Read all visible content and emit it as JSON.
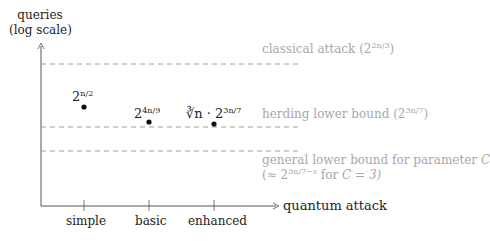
{
  "y_axis": {
    "label_line1": "queries",
    "label_line2": "(log scale)"
  },
  "x_axis": {
    "label": "quantum attack",
    "ticks": [
      "simple",
      "basic",
      "enhanced"
    ]
  },
  "points": [
    {
      "name": "simple",
      "base": "2",
      "exp": "n/2",
      "prefix": ""
    },
    {
      "name": "basic",
      "base": "2",
      "exp": "4n/9",
      "prefix": ""
    },
    {
      "name": "enhanced",
      "base": "2",
      "exp": "3n/7",
      "prefix": "∛n · "
    }
  ],
  "bounds": [
    {
      "text": "classical attack (",
      "base": "2",
      "exp": "2n/3",
      "close": ")"
    },
    {
      "text": "herding lower bound (",
      "base": "2",
      "exp": "3n/7",
      "close": ")"
    },
    {
      "text": "general lower bound for parameter ",
      "param": "C",
      "line2_pre": "(≈ ",
      "base": "2",
      "exp": "3n/7−s",
      "line2_post": " for ",
      "cond": "C = 3)"
    }
  ],
  "colors": {
    "axis": "#555555",
    "dash": "#8a8a8a",
    "text": "#222222",
    "muted": "#a8a8a8"
  }
}
